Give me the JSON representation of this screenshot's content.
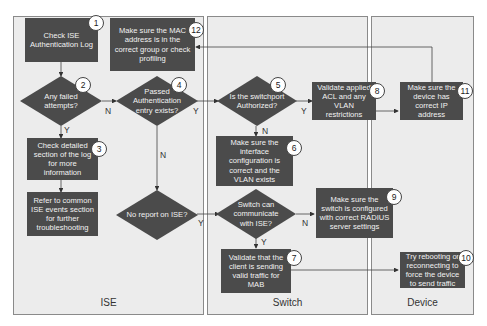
{
  "lanes": [
    {
      "id": "ise",
      "label": "ISE"
    },
    {
      "id": "switch",
      "label": "Switch"
    },
    {
      "id": "device",
      "label": "Device"
    }
  ],
  "steps": {
    "s1": {
      "num": "1",
      "text": "Check ISE Authentication Log"
    },
    "s2": {
      "num": "2",
      "text": "Any failed attempts?"
    },
    "s3": {
      "num": "3",
      "text": "Check detailed section of the log for more information"
    },
    "s3b": {
      "text": "Refer to common ISE events section for further troubleshooting"
    },
    "s4": {
      "num": "4",
      "text": "Passed Authentication entry exists?"
    },
    "s4b": {
      "text": "No report on ISE?"
    },
    "s5": {
      "num": "5",
      "text": "Is the switchport Authorized?"
    },
    "s6": {
      "num": "6",
      "text": "Make sure the interface configuration is correct and the VLAN exists"
    },
    "s5b": {
      "text": "Switch can communicate with ISE?"
    },
    "s7": {
      "num": "7",
      "text": "Validate that the client is sending valid traffic for MAB"
    },
    "s8": {
      "num": "8",
      "text": "Validate applied ACL and any VLAN restrictions"
    },
    "s9": {
      "num": "9",
      "text": "Make sure the switch is configured with correct RADIUS server settings"
    },
    "s10": {
      "num": "10",
      "text": "Try rebooting or reconnecting to force the device to send traffic"
    },
    "s11": {
      "num": "11",
      "text": "Make sure the device has correct IP address"
    },
    "s12": {
      "num": "12",
      "text": "Make sure the MAC address is in the correct group or check profiling"
    }
  },
  "edge_labels": {
    "s2_yes": "Y",
    "s2_no": "N",
    "s4_yes": "Y",
    "s4_no": "N",
    "s4b_yes": "Y",
    "s5_yes": "Y",
    "s5_no": "N",
    "s5b_yes": "Y",
    "s5b_no": "N"
  },
  "colors": {
    "box": "#4b4b4b",
    "lane": "#ececec",
    "border": "#8a8a8a"
  }
}
